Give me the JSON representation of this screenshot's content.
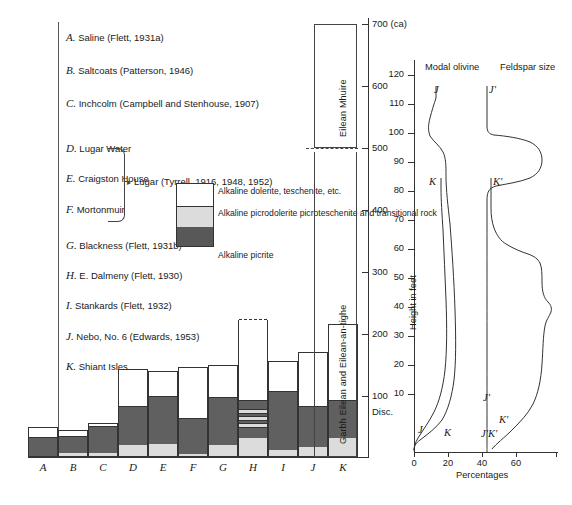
{
  "captions": [
    {
      "letter": "A.",
      "text": "Saline (Flett, 1931a)",
      "top": 37
    },
    {
      "letter": "B.",
      "text": "Saltcoats (Patterson, 1946)",
      "top": 70
    },
    {
      "letter": "C.",
      "text": "Inchcolm (Campbell and  Stenhouse, 1907)",
      "top": 103
    },
    {
      "letter": "D.",
      "text": "Lugar Water",
      "top": 148
    },
    {
      "letter": "E.",
      "text": "Craigston House",
      "top": 178
    },
    {
      "letter": "F.",
      "text": "Mortonmuir",
      "top": 209
    },
    {
      "letter": "G.",
      "text": "Blackness (Flett, 1931b)",
      "top": 245
    },
    {
      "letter": "H.",
      "text": "E. Dalmeny (Flett, 1930)",
      "top": 275
    },
    {
      "letter": "I.",
      "text": "Stankards  (Flett, 1932)",
      "top": 305
    },
    {
      "letter": "J.",
      "text": "Nebo, No. 6 (Edwards, 1953)",
      "top": 336
    },
    {
      "letter": "K.",
      "text": "Shiant Isles",
      "top": 366
    }
  ],
  "lugar_reference": "Lugar (Tyrrell, 1916, 1948, 1952)",
  "key": {
    "items": [
      {
        "swatch": "white",
        "label": "Alkaline dolerite,\nteschenite, etc.",
        "top": 188
      },
      {
        "swatch": "light",
        "label": "Alkaline picrodolerite\npicroteschenite and\ntransitional rock",
        "top": 210
      },
      {
        "swatch": "dark",
        "label": "Alkaline picrite",
        "top": 243
      }
    ]
  },
  "chart_data": {
    "type": "bar",
    "xlabel": "",
    "ylabel": "Thickness (feet)",
    "stack_order": [
      "alkaline_picrite_basal_light",
      "alkaline_picrite",
      "alkaline_dolerite_white"
    ],
    "categories": [
      "A",
      "B",
      "C",
      "D",
      "E",
      "F",
      "G",
      "H",
      "I",
      "J",
      "K"
    ],
    "series": [
      {
        "name": "Alkaline dolerite, teschenite, etc.",
        "color": "#ffffff",
        "values": [
          19,
          12,
          7,
          57,
          40,
          78,
          50,
          122,
          47,
          83,
          115
        ]
      },
      {
        "name": "Alkaline picrodolerite, picroteschenite and transitional rock",
        "color": "#dcdcdc",
        "values": [
          0,
          5,
          4,
          17,
          18,
          3,
          16,
          27,
          9,
          13,
          26
        ]
      },
      {
        "name": "Alkaline picrite",
        "color": "#606060",
        "values": [
          26,
          23,
          39,
          56,
          70,
          52,
          70,
          54,
          86,
          60,
          56
        ]
      }
    ],
    "totals": [
      45,
      40,
      50,
      130,
      128,
      133,
      136,
      203,
      142,
      156,
      197
    ],
    "dashed_top_categories": [
      "H"
    ],
    "ylim": [
      0,
      240
    ],
    "grid": false,
    "legend": "inline-key"
  },
  "strat_column": {
    "upper": {
      "label": "Eilean Mhuire",
      "top_value": "700 (ca)",
      "bottom_value": 500
    },
    "lower": {
      "label": "Garbh Eilean and Eilean-an-tighe",
      "top_value": 500,
      "bottom_value": 0
    },
    "scale_ticks": [
      {
        "value": "700 (ca)",
        "y": 24
      },
      {
        "value": "600",
        "y": 86
      },
      {
        "value": "500",
        "y": 148
      },
      {
        "value": "400",
        "y": 210
      },
      {
        "value": "300",
        "y": 272
      },
      {
        "value": "200",
        "y": 334
      },
      {
        "value": "100",
        "y": 396
      }
    ],
    "disconformity_label": "Disc."
  },
  "panels": {
    "modal_olivine": {
      "title": "Modal olivine",
      "curves": [
        {
          "name": "J",
          "label": "J",
          "label_top": 90,
          "label_left": 432
        },
        {
          "name": "K",
          "label": "K",
          "label_top": 181,
          "label_left": 429
        }
      ],
      "base_labels": [
        {
          "label": "J",
          "left": 420,
          "top": 428
        },
        {
          "label": "K",
          "left": 443,
          "top": 430
        }
      ]
    },
    "feldspar_size": {
      "title": "Feldspar size",
      "curves": [
        {
          "name": "J'",
          "label": "J'",
          "label_top": 90,
          "label_left": 484
        },
        {
          "name": "K'",
          "label": "K'",
          "label_top": 181,
          "label_left": 484
        }
      ],
      "base_labels": [
        {
          "label": "J'",
          "left": 484,
          "top": 396
        },
        {
          "label": "K'",
          "left": 498,
          "top": 418
        },
        {
          "label": "J'K'",
          "left": 483,
          "top": 430
        }
      ]
    },
    "height_axis": {
      "title": "Height in feet",
      "ticks": [
        120,
        110,
        100,
        90,
        80,
        70,
        60,
        50,
        40,
        30,
        20,
        10
      ],
      "tick_ys": [
        75,
        104,
        133,
        162,
        191,
        220,
        249,
        278,
        307,
        336,
        365,
        394
      ]
    },
    "percentage_axis": {
      "title": "Percentages",
      "ticks": [
        "0",
        "20",
        "40",
        "60"
      ],
      "tick_xs": [
        414,
        448,
        482,
        516
      ]
    }
  }
}
